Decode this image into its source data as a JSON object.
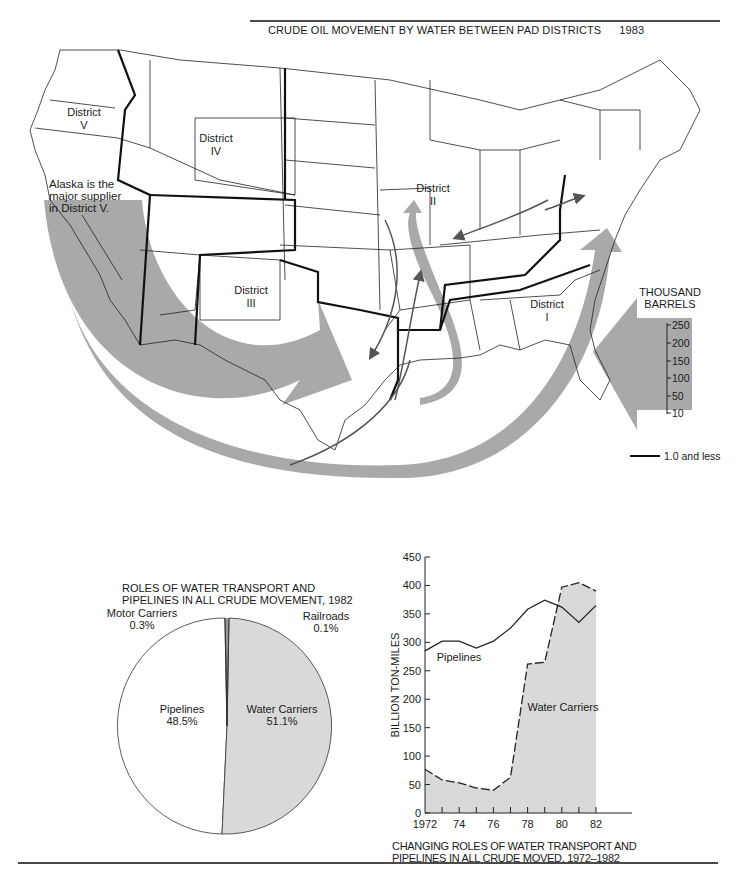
{
  "map": {
    "title": "CRUDE OIL MOVEMENT BY WATER BETWEEN PAD DISTRICTS",
    "year": "1983",
    "districts": [
      {
        "name": "District",
        "num": "V"
      },
      {
        "name": "District",
        "num": "IV"
      },
      {
        "name": "District",
        "num": "III"
      },
      {
        "name": "District",
        "num": "II"
      },
      {
        "name": "District",
        "num": "I"
      }
    ],
    "annotation": [
      "Alaska is the",
      "major supplier",
      "in District V."
    ],
    "legend": {
      "title_line1": "THOUSAND",
      "title_line2": "BARRELS",
      "ticks": [
        "250",
        "200",
        "150",
        "100",
        "50",
        "10"
      ],
      "thin_line_label": "1.0 and less"
    },
    "colors": {
      "flow_arrow": "#a9a9a9",
      "border": "#1a1a1a"
    }
  },
  "chart_data": [
    {
      "type": "pie",
      "title": "ROLES OF WATER TRANSPORT AND PIPELINES IN ALL CRUDE MOVEMENT, 1982",
      "title_line1": "ROLES OF WATER TRANSPORT AND",
      "title_line2": "PIPELINES IN ALL CRUDE MOVEMENT, 1982",
      "slices": [
        {
          "label": "Water Carriers",
          "value": 51.1,
          "display": "51.1%",
          "color": "#d9d9d9"
        },
        {
          "label": "Pipelines",
          "value": 48.5,
          "display": "48.5%",
          "color": "#ffffff"
        },
        {
          "label": "Motor Carriers",
          "value": 0.3,
          "display": "0.3%",
          "color": "#555555"
        },
        {
          "label": "Railroads",
          "value": 0.1,
          "display": "0.1%",
          "color": "#555555"
        }
      ]
    },
    {
      "type": "area",
      "title": "CHANGING ROLES OF WATER TRANSPORT AND PIPELINES IN ALL CRUDE MOVED, 1972-1982",
      "title_line1": "CHANGING ROLES OF WATER TRANSPORT AND",
      "title_line2": "PIPELINES IN ALL CRUDE MOVED, 1972–1982",
      "xlabel": "",
      "ylabel": "BILLION TON-MILES",
      "x": [
        1972,
        1973,
        1974,
        1975,
        1976,
        1977,
        1978,
        1979,
        1980,
        1981,
        1982
      ],
      "xtick_labels": [
        "1972",
        "74",
        "76",
        "78",
        "80",
        "82"
      ],
      "ytick_labels": [
        "0",
        "50",
        "100",
        "150",
        "200",
        "250",
        "300",
        "350",
        "400",
        "450"
      ],
      "ylim": [
        0,
        450
      ],
      "grid": false,
      "series": [
        {
          "name": "Pipelines",
          "style": "solid line",
          "values": [
            285,
            302,
            302,
            290,
            302,
            325,
            358,
            374,
            362,
            335,
            365
          ]
        },
        {
          "name": "Water Carriers",
          "style": "dashed line with shaded area",
          "color": "#d9d9d9",
          "values": [
            77,
            58,
            53,
            44,
            40,
            63,
            262,
            265,
            397,
            405,
            390
          ]
        }
      ]
    }
  ]
}
